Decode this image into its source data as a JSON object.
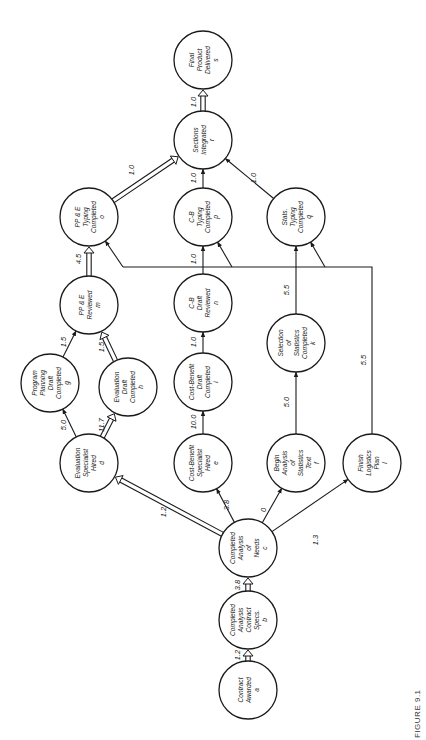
{
  "figure": {
    "caption": "FIGURE 9.1",
    "orientation": "rotated-90-ccw"
  },
  "colors": {
    "background": "#ffffff",
    "stroke": "#1a1a1a",
    "text": "#222222"
  },
  "nodes": [
    {
      "id": "a",
      "lines": [
        "Contract",
        "Awarded",
        "a"
      ],
      "cx": 248,
      "cy": 690,
      "r": 29
    },
    {
      "id": "b",
      "lines": [
        "Completed",
        "Analysis",
        "Contract",
        "Specs.",
        "b"
      ],
      "cx": 248,
      "cy": 620,
      "r": 29
    },
    {
      "id": "c",
      "lines": [
        "Completed",
        "Analysis",
        "of",
        "Needs",
        "c"
      ],
      "cx": 248,
      "cy": 548,
      "r": 29
    },
    {
      "id": "d",
      "lines": [
        "Evaluation",
        "Specialist",
        "Hired",
        "d"
      ],
      "cx": 89,
      "cy": 463,
      "r": 29
    },
    {
      "id": "e",
      "lines": [
        "Cost-Benefit",
        "Specialist",
        "Hired",
        "e"
      ],
      "cx": 203,
      "cy": 463,
      "r": 29
    },
    {
      "id": "f",
      "lines": [
        "Begin",
        "Analysis",
        "of",
        "Statistics",
        "Text",
        "f"
      ],
      "cx": 296,
      "cy": 463,
      "r": 29
    },
    {
      "id": "l",
      "lines": [
        "Finish",
        "Logistics",
        "Plan",
        "l"
      ],
      "cx": 372,
      "cy": 463,
      "r": 29
    },
    {
      "id": "g",
      "lines": [
        "Program",
        "Planning",
        "Draft",
        "Completed",
        "g"
      ],
      "cx": 50,
      "cy": 383,
      "r": 29
    },
    {
      "id": "h",
      "lines": [
        "Evaluation",
        "Draft",
        "Completed",
        "h"
      ],
      "cx": 128,
      "cy": 387,
      "r": 29
    },
    {
      "id": "i",
      "lines": [
        "Cost-Benefit",
        "Draft",
        "Completed",
        "i"
      ],
      "cx": 203,
      "cy": 382,
      "r": 29
    },
    {
      "id": "k",
      "lines": [
        "Selection",
        "of",
        "Statistics",
        "Completed",
        "k"
      ],
      "cx": 296,
      "cy": 343,
      "r": 29
    },
    {
      "id": "m",
      "lines": [
        "PP & E",
        "Reviewed",
        "m"
      ],
      "cx": 89,
      "cy": 305,
      "r": 29
    },
    {
      "id": "n",
      "lines": [
        "C-B",
        "Draft",
        "Reviewed",
        "n"
      ],
      "cx": 203,
      "cy": 303,
      "r": 29
    },
    {
      "id": "o",
      "lines": [
        "PP & E",
        "Typing",
        "Completed",
        "o"
      ],
      "cx": 89,
      "cy": 217,
      "r": 29
    },
    {
      "id": "p",
      "lines": [
        "C-B",
        "Typing",
        "Completed",
        "p"
      ],
      "cx": 203,
      "cy": 217,
      "r": 29
    },
    {
      "id": "q",
      "lines": [
        "Stats.",
        "Typing",
        "Completed",
        "q"
      ],
      "cx": 296,
      "cy": 217,
      "r": 29
    },
    {
      "id": "r",
      "lines": [
        "Sections",
        "Integrated",
        "r"
      ],
      "cx": 203,
      "cy": 140,
      "r": 29
    },
    {
      "id": "s",
      "lines": [
        "Final",
        "Product",
        "Delivered",
        "s"
      ],
      "cx": 203,
      "cy": 60,
      "r": 29
    }
  ],
  "edges": [
    {
      "from": "a",
      "to": "b",
      "duration": "1.2",
      "critical": true
    },
    {
      "from": "b",
      "to": "c",
      "duration": "3.8",
      "critical": true
    },
    {
      "from": "c",
      "to": "d",
      "duration": "1.2",
      "critical": true
    },
    {
      "from": "c",
      "to": "e",
      "duration": "3.8",
      "critical": false
    },
    {
      "from": "c",
      "to": "f",
      "duration": "0",
      "critical": false
    },
    {
      "from": "c",
      "to": "l",
      "duration": "1.3",
      "critical": false
    },
    {
      "from": "d",
      "to": "g",
      "duration": "5.0",
      "critical": false
    },
    {
      "from": "d",
      "to": "h",
      "duration": "11.7",
      "critical": true
    },
    {
      "from": "g",
      "to": "m",
      "duration": "1.5",
      "critical": false
    },
    {
      "from": "h",
      "to": "m",
      "duration": "1.5",
      "critical": true
    },
    {
      "from": "m",
      "to": "o",
      "duration": "4.5",
      "critical": true
    },
    {
      "from": "e",
      "to": "i",
      "duration": "10.0",
      "critical": false
    },
    {
      "from": "i",
      "to": "n",
      "duration": "1.0",
      "critical": false
    },
    {
      "from": "n",
      "to": "p",
      "duration": "1.0",
      "critical": false
    },
    {
      "from": "f",
      "to": "k",
      "duration": "5.0",
      "critical": false
    },
    {
      "from": "k",
      "to": "q",
      "duration": "5.5",
      "critical": false
    },
    {
      "from": "l",
      "to": "o|p|q",
      "duration": "5.5",
      "critical": false,
      "routed": true
    },
    {
      "from": "o",
      "to": "r",
      "duration": "1.0",
      "critical": true
    },
    {
      "from": "p",
      "to": "r",
      "duration": "1.0",
      "critical": false
    },
    {
      "from": "q",
      "to": "r",
      "duration": "1.0",
      "critical": false
    },
    {
      "from": "r",
      "to": "s",
      "duration": "1.0",
      "critical": true
    }
  ],
  "logistics_bus": {
    "y": 267,
    "x_start": 123,
    "x_end": 372,
    "label": "5.5",
    "label_pos": [
      366,
      360
    ],
    "taps": [
      {
        "x": 123,
        "to": "o"
      },
      {
        "x": 232,
        "to": "p"
      },
      {
        "x": 325,
        "to": "q"
      }
    ]
  },
  "edge_label_positions": {
    "a-b": [
      240,
      655
    ],
    "b-c": [
      240,
      585
    ],
    "c-d": [
      166,
      512
    ],
    "c-e": [
      229,
      505
    ],
    "c-f": [
      266,
      510
    ],
    "c-l": [
      318,
      540
    ],
    "d-g": [
      66,
      425
    ],
    "d-h": [
      104,
      425
    ],
    "g-m": [
      66,
      342
    ],
    "h-m": [
      104,
      347
    ],
    "m-o": [
      81,
      259
    ],
    "e-i": [
      196,
      422
    ],
    "i-n": [
      196,
      342
    ],
    "n-p": [
      196,
      259
    ],
    "f-k": [
      289,
      402
    ],
    "k-q": [
      289,
      290
    ],
    "o-r": [
      134,
      170
    ],
    "p-r": [
      196,
      178
    ],
    "q-r": [
      256,
      178
    ],
    "r-s": [
      196,
      102
    ]
  }
}
